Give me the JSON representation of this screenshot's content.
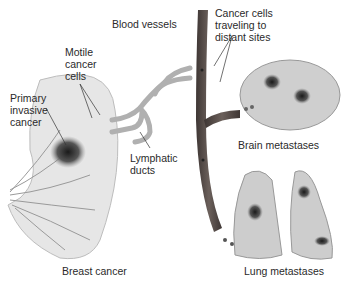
{
  "labels": {
    "blood_vessels": "Blood vessels",
    "cancer_cells_traveling": [
      "Cancer cells",
      "traveling to",
      "distant sites"
    ],
    "motile_cancer_cells": [
      "Motile",
      "cancer",
      "cells"
    ],
    "primary_invasive_cancer": [
      "Primary",
      "invasive",
      "cancer"
    ],
    "lymphatic_ducts": [
      "Lymphatic",
      "ducts"
    ],
    "brain_metastases": "Brain metastases",
    "breast_cancer": "Breast cancer",
    "lung_metastases": "Lung metastases"
  },
  "colors": {
    "vessel": "#5a4e4a",
    "lymph": "#a9a9a9",
    "tissue": "#d9d9d9",
    "tumor": "#2a2a2a",
    "organ": "#c8c8c8"
  }
}
